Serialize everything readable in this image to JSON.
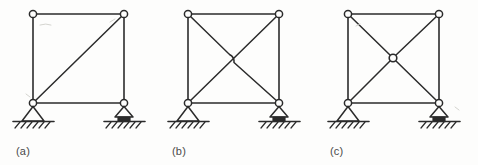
{
  "figure": {
    "background_color": "#fdfdfc",
    "line_color": "#2b2b2b",
    "panel_count": 3,
    "common": {
      "frame_shape": "square",
      "joint_type": "pin",
      "left_support": "pinned-support",
      "right_support": "roller-support",
      "ground": "hatched-ground"
    },
    "panels": [
      {
        "id": "a",
        "label": "(a)",
        "description": "Square frame with a single diagonal brace from the bottom-left joint to the top-right joint",
        "frame": {
          "x": 33,
          "y": 14,
          "width": 91,
          "height": 89
        },
        "joints": [
          {
            "name": "top-left",
            "x": 33,
            "y": 14
          },
          {
            "name": "top-right",
            "x": 124,
            "y": 14
          },
          {
            "name": "bottom-left",
            "x": 33,
            "y": 103
          },
          {
            "name": "bottom-right",
            "x": 124,
            "y": 103
          }
        ],
        "members": [
          {
            "name": "top-chord",
            "from": "top-left",
            "to": "top-right"
          },
          {
            "name": "left-column",
            "from": "top-left",
            "to": "bottom-left"
          },
          {
            "name": "right-column",
            "from": "top-right",
            "to": "bottom-right"
          },
          {
            "name": "bottom-chord",
            "from": "bottom-left",
            "to": "bottom-right"
          },
          {
            "name": "diagonal-brace",
            "from": "bottom-left",
            "to": "top-right"
          }
        ],
        "center_connection": "none",
        "diagonal_count": 1,
        "supports": [
          {
            "name": "left-pinned-support",
            "type": "pinned",
            "x": 33,
            "y": 103
          },
          {
            "name": "right-roller-support",
            "type": "roller",
            "x": 124,
            "y": 103
          }
        ]
      },
      {
        "id": "b",
        "label": "(b)",
        "description": "Square frame with two crossing diagonal braces that pass over one another without connecting at the intersection",
        "frame": {
          "x": 188,
          "y": 14,
          "width": 91,
          "height": 89
        },
        "joints": [
          {
            "name": "top-left",
            "x": 188,
            "y": 14
          },
          {
            "name": "top-right",
            "x": 279,
            "y": 14
          },
          {
            "name": "bottom-left",
            "x": 188,
            "y": 103
          },
          {
            "name": "bottom-right",
            "x": 279,
            "y": 103
          }
        ],
        "members": [
          {
            "name": "top-chord",
            "from": "top-left",
            "to": "top-right"
          },
          {
            "name": "left-column",
            "from": "top-left",
            "to": "bottom-left"
          },
          {
            "name": "right-column",
            "from": "top-right",
            "to": "bottom-right"
          },
          {
            "name": "bottom-chord",
            "from": "bottom-left",
            "to": "bottom-right"
          },
          {
            "name": "diagonal-brace-rising",
            "from": "bottom-left",
            "to": "top-right"
          },
          {
            "name": "diagonal-brace-falling",
            "from": "top-left",
            "to": "bottom-right"
          }
        ],
        "center_connection": "crossing-unconnected",
        "diagonal_count": 2,
        "supports": [
          {
            "name": "left-pinned-support",
            "type": "pinned",
            "x": 188,
            "y": 103
          },
          {
            "name": "right-roller-support",
            "type": "roller",
            "x": 279,
            "y": 103
          }
        ]
      },
      {
        "id": "c",
        "label": "(c)",
        "description": "Square frame with two diagonal braces connected together by a pin joint at the centre of the panel",
        "frame": {
          "x": 348,
          "y": 14,
          "width": 91,
          "height": 89
        },
        "joints": [
          {
            "name": "top-left",
            "x": 348,
            "y": 14
          },
          {
            "name": "top-right",
            "x": 439,
            "y": 14
          },
          {
            "name": "bottom-left",
            "x": 348,
            "y": 103
          },
          {
            "name": "bottom-right",
            "x": 439,
            "y": 103
          },
          {
            "name": "centre",
            "x": 393,
            "y": 58
          }
        ],
        "members": [
          {
            "name": "top-chord",
            "from": "top-left",
            "to": "top-right"
          },
          {
            "name": "left-column",
            "from": "top-left",
            "to": "bottom-left"
          },
          {
            "name": "right-column",
            "from": "top-right",
            "to": "bottom-right"
          },
          {
            "name": "bottom-chord",
            "from": "bottom-left",
            "to": "bottom-right"
          },
          {
            "name": "brace-bottom-left-to-centre",
            "from": "bottom-left",
            "to": "centre"
          },
          {
            "name": "brace-centre-to-top-right",
            "from": "centre",
            "to": "top-right"
          },
          {
            "name": "brace-top-left-to-centre",
            "from": "top-left",
            "to": "centre"
          },
          {
            "name": "brace-centre-to-bottom-right",
            "from": "centre",
            "to": "bottom-right"
          }
        ],
        "center_connection": "pinned-centre-joint",
        "diagonal_count": 2,
        "supports": [
          {
            "name": "left-pinned-support",
            "type": "pinned",
            "x": 348,
            "y": 103
          },
          {
            "name": "right-roller-support",
            "type": "roller",
            "x": 439,
            "y": 103
          }
        ]
      }
    ],
    "label_positions": [
      {
        "id": "a",
        "x": 16,
        "y": 155
      },
      {
        "id": "b",
        "x": 172,
        "y": 155
      },
      {
        "id": "c",
        "x": 330,
        "y": 155
      }
    ]
  }
}
